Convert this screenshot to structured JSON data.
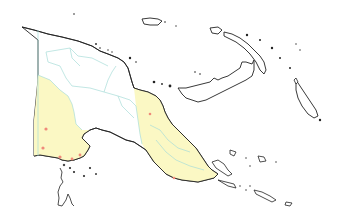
{
  "map": {
    "subject": "Papua New Guinea",
    "colors": {
      "background": "#ffffff",
      "land_default": "#ffffff",
      "land_highlight": "#fbf8c4",
      "coastline": "#222222",
      "province_border": "#a8dcd8",
      "marker": "#f08a7a"
    },
    "highlighted_regions": [
      "Western",
      "Gulf",
      "Central",
      "Morobe",
      "Oro"
    ],
    "markers": [
      {
        "x": 46,
        "y": 129
      },
      {
        "x": 43,
        "y": 148
      },
      {
        "x": 60,
        "y": 157
      },
      {
        "x": 72,
        "y": 159
      },
      {
        "x": 80,
        "y": 155
      },
      {
        "x": 150,
        "y": 114
      },
      {
        "x": 174,
        "y": 178
      }
    ]
  }
}
